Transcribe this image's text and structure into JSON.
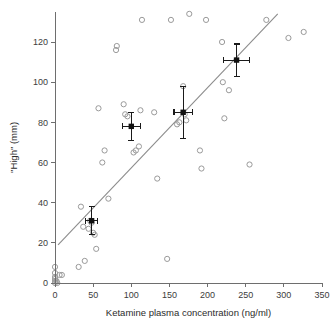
{
  "chart_data": {
    "type": "scatter",
    "title": "",
    "xlabel": "Ketamine plasma concentration (ng/ml)",
    "ylabel": "\"High\" (mm)",
    "xlim": [
      0,
      350
    ],
    "ylim": [
      0,
      135
    ],
    "xticks": [
      0,
      50,
      100,
      150,
      200,
      250,
      300,
      350
    ],
    "yticks": [
      0,
      20,
      40,
      60,
      80,
      100,
      120
    ],
    "grid": false,
    "legend": null,
    "series": [
      {
        "name": "individual observations",
        "marker": "open-circle",
        "color": "#9a9a9a",
        "points": [
          [
            0,
            0
          ],
          [
            0,
            1
          ],
          [
            0,
            2
          ],
          [
            0,
            3
          ],
          [
            0,
            5
          ],
          [
            0,
            8
          ],
          [
            2,
            1
          ],
          [
            3,
            0
          ],
          [
            6,
            4
          ],
          [
            9,
            4
          ],
          [
            31,
            8
          ],
          [
            34,
            38
          ],
          [
            37,
            28
          ],
          [
            39,
            11
          ],
          [
            44,
            27
          ],
          [
            46,
            31
          ],
          [
            48,
            30
          ],
          [
            50,
            25
          ],
          [
            52,
            24
          ],
          [
            54,
            17
          ],
          [
            57,
            87
          ],
          [
            62,
            60
          ],
          [
            65,
            66
          ],
          [
            70,
            42
          ],
          [
            80,
            116
          ],
          [
            81,
            118
          ],
          [
            90,
            89
          ],
          [
            92,
            84
          ],
          [
            95,
            83
          ],
          [
            103,
            65
          ],
          [
            106,
            66
          ],
          [
            110,
            68
          ],
          [
            112,
            86
          ],
          [
            114,
            131
          ],
          [
            130,
            85
          ],
          [
            134,
            52
          ],
          [
            147,
            12
          ],
          [
            152,
            131
          ],
          [
            160,
            79
          ],
          [
            163,
            80
          ],
          [
            168,
            98
          ],
          [
            170,
            84
          ],
          [
            172,
            81
          ],
          [
            176,
            134
          ],
          [
            190,
            66
          ],
          [
            192,
            57
          ],
          [
            198,
            131
          ],
          [
            219,
            120
          ],
          [
            220,
            100
          ],
          [
            222,
            82
          ],
          [
            228,
            96
          ],
          [
            255,
            59
          ],
          [
            277,
            131
          ],
          [
            306,
            122
          ],
          [
            326,
            125
          ]
        ]
      }
    ],
    "mean_points": {
      "name": "group means with SEM",
      "marker": "filled-square",
      "color": "#111111",
      "values": [
        {
          "x": 48,
          "y": 31,
          "xerr": 8,
          "yerr": 7
        },
        {
          "x": 100,
          "y": 78,
          "xerr": 12,
          "yerr": 7
        },
        {
          "x": 168,
          "y": 85,
          "xerr": 12,
          "yerr": 13
        },
        {
          "x": 238,
          "y": 111,
          "xerr": 17,
          "yerr": 8
        }
      ]
    },
    "fit_line": {
      "name": "linear regression",
      "color": "#8c8c8c",
      "x_start": 4,
      "y_start": 19,
      "x_end": 292,
      "y_end": 134
    }
  },
  "axes": {
    "x_title": "Ketamine plasma concentration (ng/ml)",
    "y_title": "\"High\" (mm)",
    "x_tick_labels": [
      "0",
      "50",
      "100",
      "150",
      "200",
      "250",
      "300",
      "350"
    ],
    "y_tick_labels": [
      "0",
      "20",
      "40",
      "60",
      "80",
      "100",
      "120"
    ]
  },
  "colors": {
    "axis": "#6e6e6e",
    "point": "#9a9a9a",
    "mean": "#111111",
    "fit": "#8c8c8c",
    "background": "#ffffff"
  }
}
